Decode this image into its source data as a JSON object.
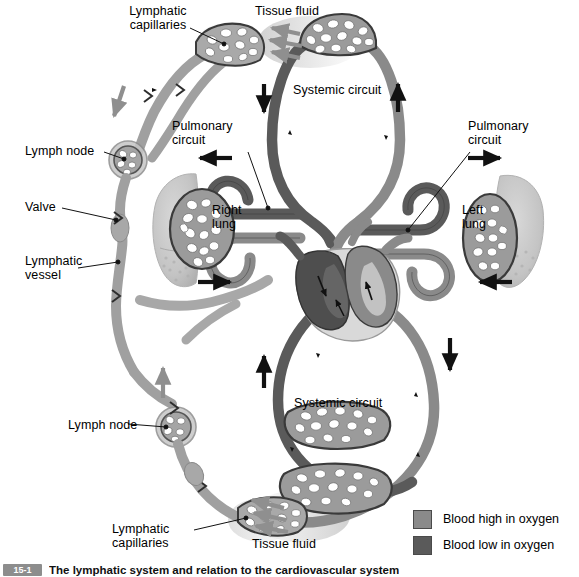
{
  "figure": {
    "title": "The lymphatic system and relation to the cardiovascular system",
    "caption_number": "15-1",
    "caption_text": "The lymphatic system and relation to the cardiovascular system"
  },
  "labels": {
    "lymphatic_capillaries_top": "Lymphatic\ncapillaries",
    "tissue_fluid_top": "Tissue fluid",
    "systemic_circuit_top": "Systemic circuit",
    "pulmonary_circuit_left": "Pulmonary\ncircuit",
    "pulmonary_circuit_right": "Pulmonary\ncircuit",
    "lymph_node_upper": "Lymph node",
    "valve": "Valve",
    "lymphatic_vessel": "Lymphatic\nvessel",
    "right_lung": "Right\nlung",
    "left_lung": "Left\nlung",
    "lymph_node_lower": "Lymph node",
    "systemic_circuit_bottom": "Systemic circuit",
    "lymphatic_capillaries_bottom": "Lymphatic\ncapillaries",
    "tissue_fluid_bottom": "Tissue fluid"
  },
  "legend": {
    "items": [
      {
        "label": "Blood high in oxygen",
        "color": "#8a8a8a",
        "name": "oxygenated"
      },
      {
        "label": "Blood low in oxygen",
        "color": "#5a5a5a",
        "name": "deoxygenated"
      }
    ]
  },
  "colors": {
    "blood_high_oxygen": "#8a8a8a",
    "blood_low_oxygen": "#5a5a5a",
    "lymph_vessel": "#9a9a9a",
    "lymph_vessel_light": "#b4b4b4",
    "lung_tissue": "#c3c3c3",
    "tissue_fluid_arrow": "#8f8f8f",
    "outline": "#3a3a3a",
    "arrow_black": "#111111",
    "background": "#ffffff"
  }
}
